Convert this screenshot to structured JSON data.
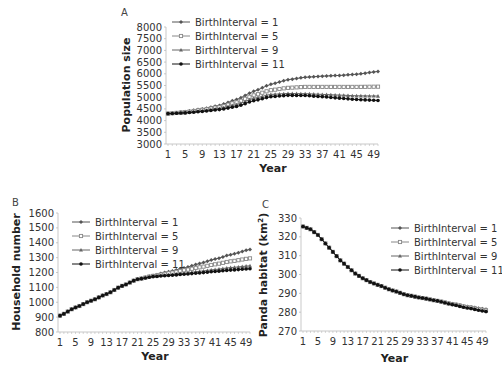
{
  "chart_data": [
    {
      "id": "A",
      "panel_label": "A",
      "type": "line",
      "title": "",
      "xlabel": "Year",
      "ylabel": "Population size",
      "ylim": [
        3000,
        8000
      ],
      "yticks": [
        3000,
        3500,
        4000,
        4500,
        5000,
        5500,
        6000,
        6500,
        7000,
        7500,
        8000
      ],
      "xtick_labels": [
        "1",
        "5",
        "9",
        "13",
        "17",
        "21",
        "25",
        "29",
        "33",
        "37",
        "41",
        "45",
        "49"
      ],
      "x_range": [
        1,
        50
      ],
      "grid": false,
      "legend_position": "upper-left",
      "series": [
        {
          "name": "BirthInterval = 1",
          "marker": "diamond",
          "color": "#555555",
          "keypoints": [
            [
              1,
              4300
            ],
            [
              5,
              4380
            ],
            [
              9,
              4500
            ],
            [
              13,
              4650
            ],
            [
              17,
              4900
            ],
            [
              21,
              5250
            ],
            [
              25,
              5550
            ],
            [
              29,
              5750
            ],
            [
              33,
              5850
            ],
            [
              37,
              5900
            ],
            [
              41,
              5930
            ],
            [
              45,
              5980
            ],
            [
              50,
              6100
            ]
          ]
        },
        {
          "name": "BirthInterval = 5",
          "marker": "square",
          "color": "#888888",
          "keypoints": [
            [
              1,
              4300
            ],
            [
              5,
              4360
            ],
            [
              9,
              4460
            ],
            [
              13,
              4580
            ],
            [
              17,
              4780
            ],
            [
              21,
              5080
            ],
            [
              25,
              5300
            ],
            [
              29,
              5400
            ],
            [
              33,
              5440
            ],
            [
              37,
              5440
            ],
            [
              41,
              5440
            ],
            [
              45,
              5440
            ],
            [
              50,
              5450
            ]
          ]
        },
        {
          "name": "BirthInterval = 9",
          "marker": "triangle",
          "color": "#666666",
          "keypoints": [
            [
              1,
              4300
            ],
            [
              5,
              4340
            ],
            [
              9,
              4420
            ],
            [
              13,
              4520
            ],
            [
              17,
              4680
            ],
            [
              21,
              4950
            ],
            [
              25,
              5120
            ],
            [
              29,
              5160
            ],
            [
              33,
              5150
            ],
            [
              37,
              5120
            ],
            [
              41,
              5090
            ],
            [
              45,
              5060
            ],
            [
              50,
              5050
            ]
          ]
        },
        {
          "name": "BirthInterval = 11",
          "marker": "circle",
          "color": "#111111",
          "keypoints": [
            [
              1,
              4300
            ],
            [
              5,
              4330
            ],
            [
              9,
              4390
            ],
            [
              13,
              4470
            ],
            [
              17,
              4600
            ],
            [
              21,
              4850
            ],
            [
              25,
              5020
            ],
            [
              29,
              5080
            ],
            [
              33,
              5070
            ],
            [
              37,
              5020
            ],
            [
              41,
              4960
            ],
            [
              45,
              4900
            ],
            [
              50,
              4860
            ]
          ]
        }
      ]
    },
    {
      "id": "B",
      "panel_label": "B",
      "type": "line",
      "title": "",
      "xlabel": "Year",
      "ylabel": "Household number",
      "ylim": [
        800,
        1600
      ],
      "yticks": [
        800,
        900,
        1000,
        1100,
        1200,
        1300,
        1400,
        1500,
        1600
      ],
      "xtick_labels": [
        "1",
        "5",
        "9",
        "13",
        "17",
        "21",
        "25",
        "29",
        "33",
        "37",
        "41",
        "45",
        "49"
      ],
      "x_range": [
        1,
        50
      ],
      "grid": false,
      "legend_position": "upper-left",
      "series": [
        {
          "name": "BirthInterval = 1",
          "marker": "diamond",
          "color": "#555555",
          "keypoints": [
            [
              1,
              910
            ],
            [
              5,
              965
            ],
            [
              9,
              1010
            ],
            [
              13,
              1055
            ],
            [
              17,
              1110
            ],
            [
              21,
              1155
            ],
            [
              25,
              1180
            ],
            [
              29,
              1205
            ],
            [
              33,
              1230
            ],
            [
              37,
              1260
            ],
            [
              41,
              1290
            ],
            [
              45,
              1320
            ],
            [
              50,
              1355
            ]
          ]
        },
        {
          "name": "BirthInterval = 5",
          "marker": "square",
          "color": "#888888",
          "keypoints": [
            [
              1,
              910
            ],
            [
              5,
              965
            ],
            [
              9,
              1010
            ],
            [
              13,
              1055
            ],
            [
              17,
              1110
            ],
            [
              21,
              1155
            ],
            [
              25,
              1177
            ],
            [
              29,
              1195
            ],
            [
              33,
              1215
            ],
            [
              37,
              1235
            ],
            [
              41,
              1255
            ],
            [
              45,
              1275
            ],
            [
              50,
              1295
            ]
          ]
        },
        {
          "name": "BirthInterval = 9",
          "marker": "triangle",
          "color": "#666666",
          "keypoints": [
            [
              1,
              910
            ],
            [
              5,
              965
            ],
            [
              9,
              1010
            ],
            [
              13,
              1055
            ],
            [
              17,
              1110
            ],
            [
              21,
              1155
            ],
            [
              25,
              1175
            ],
            [
              29,
              1185
            ],
            [
              33,
              1195
            ],
            [
              37,
              1208
            ],
            [
              41,
              1220
            ],
            [
              45,
              1233
            ],
            [
              50,
              1245
            ]
          ]
        },
        {
          "name": "BirthInterval = 11",
          "marker": "circle",
          "color": "#111111",
          "keypoints": [
            [
              1,
              910
            ],
            [
              5,
              965
            ],
            [
              9,
              1010
            ],
            [
              13,
              1055
            ],
            [
              17,
              1110
            ],
            [
              21,
              1155
            ],
            [
              25,
              1172
            ],
            [
              29,
              1180
            ],
            [
              33,
              1188
            ],
            [
              37,
              1197
            ],
            [
              41,
              1207
            ],
            [
              45,
              1216
            ],
            [
              50,
              1225
            ]
          ]
        }
      ]
    },
    {
      "id": "C",
      "panel_label": "C",
      "type": "line",
      "title": "",
      "xlabel": "Year",
      "ylabel": "Panda habitat (km²)",
      "ylim": [
        270,
        330
      ],
      "yticks": [
        270,
        280,
        290,
        300,
        310,
        320,
        330
      ],
      "xtick_labels": [
        "1",
        "5",
        "9",
        "13",
        "17",
        "21",
        "25",
        "29",
        "33",
        "37",
        "41",
        "45",
        "49"
      ],
      "x_range": [
        1,
        50
      ],
      "grid": false,
      "legend_position": "upper-right",
      "series": [
        {
          "name": "BirthInterval = 1",
          "marker": "diamond",
          "color": "#555555",
          "keypoints": [
            [
              1,
              325.5
            ],
            [
              3,
              324
            ],
            [
              5,
              321
            ],
            [
              7,
              316.5
            ],
            [
              9,
              312
            ],
            [
              11,
              307.5
            ],
            [
              13,
              304
            ],
            [
              15,
              300.5
            ],
            [
              17,
              298
            ],
            [
              19,
              296
            ],
            [
              21,
              294.5
            ],
            [
              25,
              291.5
            ],
            [
              29,
              289
            ],
            [
              33,
              287.5
            ],
            [
              37,
              286
            ],
            [
              41,
              284.5
            ],
            [
              45,
              283
            ],
            [
              50,
              281.5
            ]
          ]
        },
        {
          "name": "BirthInterval = 5",
          "marker": "square",
          "color": "#888888",
          "keypoints": [
            [
              1,
              325.5
            ],
            [
              3,
              324
            ],
            [
              5,
              321
            ],
            [
              7,
              316.5
            ],
            [
              9,
              312
            ],
            [
              11,
              307.5
            ],
            [
              13,
              304
            ],
            [
              15,
              300.5
            ],
            [
              17,
              298
            ],
            [
              19,
              296
            ],
            [
              21,
              294.5
            ],
            [
              25,
              291.5
            ],
            [
              29,
              289
            ],
            [
              33,
              287.5
            ],
            [
              37,
              286
            ],
            [
              41,
              284.3
            ],
            [
              45,
              282.7
            ],
            [
              50,
              281
            ]
          ]
        },
        {
          "name": "BirthInterval = 9",
          "marker": "triangle",
          "color": "#666666",
          "keypoints": [
            [
              1,
              325.5
            ],
            [
              3,
              324
            ],
            [
              5,
              321
            ],
            [
              7,
              316.5
            ],
            [
              9,
              312
            ],
            [
              11,
              307.5
            ],
            [
              13,
              304
            ],
            [
              15,
              300.5
            ],
            [
              17,
              298
            ],
            [
              19,
              296
            ],
            [
              21,
              294.5
            ],
            [
              25,
              291.5
            ],
            [
              29,
              289
            ],
            [
              33,
              287.5
            ],
            [
              37,
              286
            ],
            [
              41,
              284.1
            ],
            [
              45,
              282.4
            ],
            [
              50,
              280.6
            ]
          ]
        },
        {
          "name": "BirthInterval = 11",
          "marker": "circle",
          "color": "#111111",
          "keypoints": [
            [
              1,
              325.5
            ],
            [
              3,
              324
            ],
            [
              5,
              321
            ],
            [
              7,
              316.5
            ],
            [
              9,
              312
            ],
            [
              11,
              307.5
            ],
            [
              13,
              304
            ],
            [
              15,
              300.5
            ],
            [
              17,
              298
            ],
            [
              19,
              296
            ],
            [
              21,
              294.5
            ],
            [
              25,
              291.5
            ],
            [
              29,
              289
            ],
            [
              33,
              287.5
            ],
            [
              37,
              286
            ],
            [
              41,
              284
            ],
            [
              45,
              282.2
            ],
            [
              50,
              280.3
            ]
          ]
        }
      ]
    }
  ]
}
